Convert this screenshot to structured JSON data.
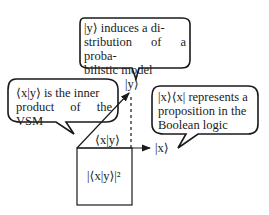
{
  "diagram": {
    "bubbles": [
      {
        "id": "top",
        "text_lines": [
          "|y⟩ induces a di-",
          "stribution of a proba-",
          "bilistic model"
        ]
      },
      {
        "id": "left",
        "text_lines": [
          "⟨x|y⟩ is the inner",
          "product of the VSM"
        ]
      },
      {
        "id": "right",
        "text_lines": [
          "|x⟩⟨x| represents a",
          "proposition in the",
          "Boolean logic"
        ]
      }
    ],
    "labels": {
      "y_vector": "|y⟩",
      "x_vector": "|x⟩",
      "inner_product": "⟨x|y⟩",
      "square_area": "|⟨x|y⟩|²"
    },
    "colors": {
      "stroke": "#1a1a1a",
      "background": "#ffffff"
    }
  }
}
